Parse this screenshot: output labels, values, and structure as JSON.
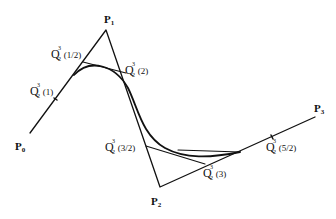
{
  "diagram": {
    "type": "bezier-subdivision",
    "control_points": [
      {
        "name": "P",
        "sub": "0",
        "x": 30,
        "y": 133
      },
      {
        "name": "P",
        "sub": "1",
        "x": 106,
        "y": 30
      },
      {
        "name": "P",
        "sub": "2",
        "x": 160,
        "y": 187
      },
      {
        "name": "P",
        "sub": "3",
        "x": 315,
        "y": 117
      }
    ],
    "labels": {
      "p0": {
        "base": "P",
        "sub": "0"
      },
      "p1": {
        "base": "P",
        "sub": "1"
      },
      "p2": {
        "base": "P",
        "sub": "2"
      },
      "p3": {
        "base": "P",
        "sub": "3"
      },
      "q_1_2": {
        "base": "Q",
        "sup": "3",
        "sub": "2",
        "arg": "(1/2)"
      },
      "q_1": {
        "base": "Q",
        "sup": "3",
        "sub": "2",
        "arg": "(1)"
      },
      "q_2": {
        "base": "Q",
        "sup": "3",
        "sub": "2",
        "arg": "(2)"
      },
      "q_3_2": {
        "base": "Q",
        "sup": "3",
        "sub": "2",
        "arg": "(3/2)"
      },
      "q_3": {
        "base": "Q",
        "sup": "3",
        "sub": "2",
        "arg": "(3)"
      },
      "q_5_2": {
        "base": "Q",
        "sup": "3",
        "sub": "2",
        "arg": "(5/2)"
      }
    },
    "colors": {
      "line": "#111111",
      "background": "#ffffff"
    }
  }
}
